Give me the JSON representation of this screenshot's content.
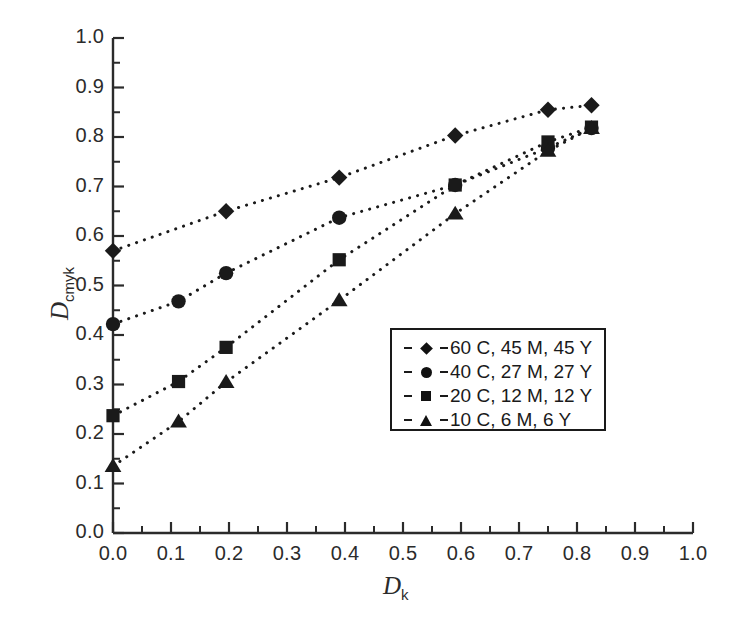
{
  "chart_data": {
    "type": "scatter",
    "title": "",
    "xlabel": "D_k",
    "ylabel": "D_cmyk",
    "xlabel_base": "D",
    "xlabel_sub": "k",
    "ylabel_base": "D",
    "ylabel_sub": "cmyk",
    "xlim": [
      0.0,
      1.0
    ],
    "ylim": [
      0.0,
      1.0
    ],
    "xticks": [
      "0.0",
      "0.1",
      "0.2",
      "0.3",
      "0.4",
      "0.5",
      "0.6",
      "0.7",
      "0.8",
      "0.9",
      "1.0"
    ],
    "yticks": [
      "0.0",
      "0.1",
      "0.2",
      "0.3",
      "0.4",
      "0.5",
      "0.6",
      "0.7",
      "0.8",
      "0.9",
      "1.0"
    ],
    "xtick_values": [
      0.0,
      0.1,
      0.2,
      0.3,
      0.4,
      0.5,
      0.6,
      0.7,
      0.8,
      0.9,
      1.0
    ],
    "ytick_values": [
      0.0,
      0.1,
      0.2,
      0.3,
      0.4,
      0.5,
      0.6,
      0.7,
      0.8,
      0.9,
      1.0
    ],
    "minor_ticks": true,
    "grid": false,
    "linestyle": "dotted",
    "legend_position": "center-right",
    "series": [
      {
        "name": "60 C, 45 M, 45 Y",
        "marker": "diamond",
        "x": [
          0.0,
          0.195,
          0.39,
          0.59,
          0.75,
          0.825
        ],
        "y": [
          0.57,
          0.65,
          0.718,
          0.803,
          0.855,
          0.864
        ]
      },
      {
        "name": "40 C, 27 M, 27 Y",
        "marker": "circle",
        "x": [
          0.0,
          0.113,
          0.195,
          0.39,
          0.59,
          0.75,
          0.825
        ],
        "y": [
          0.422,
          0.468,
          0.525,
          0.637,
          0.703,
          0.778,
          0.818
        ]
      },
      {
        "name": "20 C, 12 M, 12 Y",
        "marker": "square",
        "x": [
          0.0,
          0.113,
          0.195,
          0.39,
          0.59,
          0.75,
          0.825
        ],
        "y": [
          0.237,
          0.306,
          0.375,
          0.552,
          0.703,
          0.79,
          0.82
        ]
      },
      {
        "name": "10 C, 6 M, 6 Y",
        "marker": "triangle",
        "x": [
          0.0,
          0.113,
          0.195,
          0.39,
          0.59,
          0.75,
          0.825
        ],
        "y": [
          0.135,
          0.225,
          0.305,
          0.47,
          0.645,
          0.772,
          0.818
        ]
      }
    ]
  },
  "legend": {
    "entries": [
      {
        "marker": "diamond",
        "label": "60 C, 45 M, 45 Y"
      },
      {
        "marker": "circle",
        "label": "40 C, 27 M, 27 Y"
      },
      {
        "marker": "square",
        "label": "20 C, 12 M, 12 Y"
      },
      {
        "marker": "triangle",
        "label": "10 C, 6 M, 6 Y"
      }
    ]
  },
  "colors": {
    "ink": "#1a1a1a",
    "axis": "#2b2b2b",
    "background": "#ffffff"
  }
}
